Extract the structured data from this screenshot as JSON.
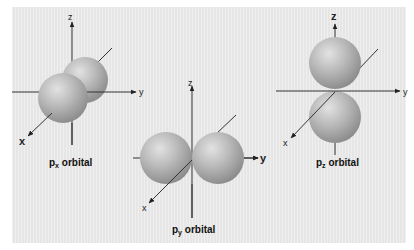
{
  "figure": {
    "background_color": "#e6e6e6",
    "sphere_color": "#b9b9b9",
    "axis_color": "#333333",
    "panels": [
      {
        "id": "px",
        "label_main": "p",
        "label_sub": "x",
        "label_rest": " orbital",
        "axes": {
          "z": "z",
          "y": "y",
          "x": "x"
        },
        "bold_axis": "x"
      },
      {
        "id": "py",
        "label_main": "p",
        "label_sub": "y",
        "label_rest": " orbital",
        "axes": {
          "z": "z",
          "y": "y",
          "x": "x"
        },
        "bold_axis": "y"
      },
      {
        "id": "pz",
        "label_main": "p",
        "label_sub": "z",
        "label_rest": " orbital",
        "axes": {
          "z": "z",
          "y": "y",
          "x": "x"
        },
        "bold_axis": "z"
      }
    ]
  }
}
